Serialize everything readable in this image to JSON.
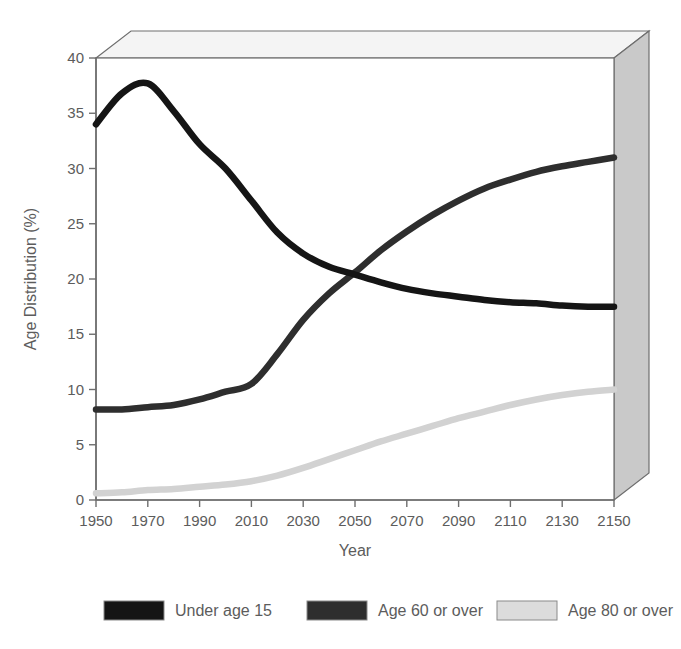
{
  "chart_data": {
    "type": "line",
    "title": "",
    "xlabel": "Year",
    "ylabel": "Age Distribution (%)",
    "xlim": [
      1950,
      2150
    ],
    "ylim": [
      0,
      40
    ],
    "xticks": [
      1950,
      1970,
      1990,
      2010,
      2030,
      2050,
      2070,
      2090,
      2110,
      2130,
      2150
    ],
    "yticks": [
      0,
      5,
      10,
      15,
      20,
      25,
      30,
      35,
      40
    ],
    "grid": false,
    "legend_position": "bottom",
    "x": [
      1950,
      1960,
      1970,
      1980,
      1990,
      2000,
      2010,
      2020,
      2030,
      2040,
      2050,
      2060,
      2070,
      2080,
      2090,
      2100,
      2110,
      2120,
      2130,
      2140,
      2150
    ],
    "series": [
      {
        "name": "Under age 15",
        "color": "#151515",
        "values": [
          34.0,
          36.8,
          37.7,
          35.2,
          32.2,
          30.0,
          27.1,
          24.2,
          22.3,
          21.1,
          20.4,
          19.7,
          19.1,
          18.7,
          18.4,
          18.1,
          17.9,
          17.8,
          17.6,
          17.5,
          17.5
        ]
      },
      {
        "name": "Age 60 or over",
        "color": "#2e2e2e",
        "values": [
          8.2,
          8.2,
          8.4,
          8.6,
          9.1,
          9.8,
          10.5,
          13.2,
          16.3,
          18.7,
          20.6,
          22.6,
          24.3,
          25.8,
          27.1,
          28.2,
          29.0,
          29.7,
          30.2,
          30.6,
          31.0
        ]
      },
      {
        "name": "Age 80 or over",
        "color": "#d2d2d2",
        "values": [
          0.6,
          0.7,
          0.9,
          1.0,
          1.2,
          1.4,
          1.7,
          2.2,
          2.9,
          3.7,
          4.5,
          5.3,
          6.0,
          6.7,
          7.4,
          8.0,
          8.6,
          9.1,
          9.5,
          9.8,
          10.0
        ]
      }
    ]
  },
  "axes": {
    "y_title": "Age Distribution (%)",
    "x_title": "Year",
    "y_tick_labels": [
      "0",
      "5",
      "10",
      "15",
      "20",
      "25",
      "30",
      "35",
      "40"
    ],
    "x_tick_labels": [
      "1950",
      "1970",
      "1990",
      "2010",
      "2030",
      "2050",
      "2070",
      "2090",
      "2110",
      "2130",
      "2150"
    ]
  },
  "legend": {
    "items": [
      {
        "label": "Under age 15",
        "color": "#151515"
      },
      {
        "label": "Age 60 or over",
        "color": "#2e2e2e"
      },
      {
        "label": "Age 80 or over",
        "color": "#dcdcdc"
      }
    ]
  },
  "style": {
    "wall_color": "#c9c9c9",
    "top_color": "#f2f2f2",
    "plot_bg": "#ffffff",
    "axis_color": "#6e6e6e"
  }
}
